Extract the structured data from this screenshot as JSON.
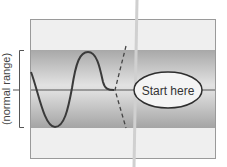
{
  "diagram": {
    "y_axis_label": "(normal range)",
    "start_label": "Start here",
    "colors": {
      "frame_fill": "#efefef",
      "frame_stroke": "#9a9a9a",
      "band_dark": "#a9a9a9",
      "band_light": "#d9d9d9",
      "wave": "#3a3a3a",
      "baseline": "#555555",
      "ellipse_fill": "#f4f4f4",
      "ellipse_stroke": "#2e2e2e",
      "cut_line": "#cfcfcf",
      "dashed": "#444444"
    }
  }
}
